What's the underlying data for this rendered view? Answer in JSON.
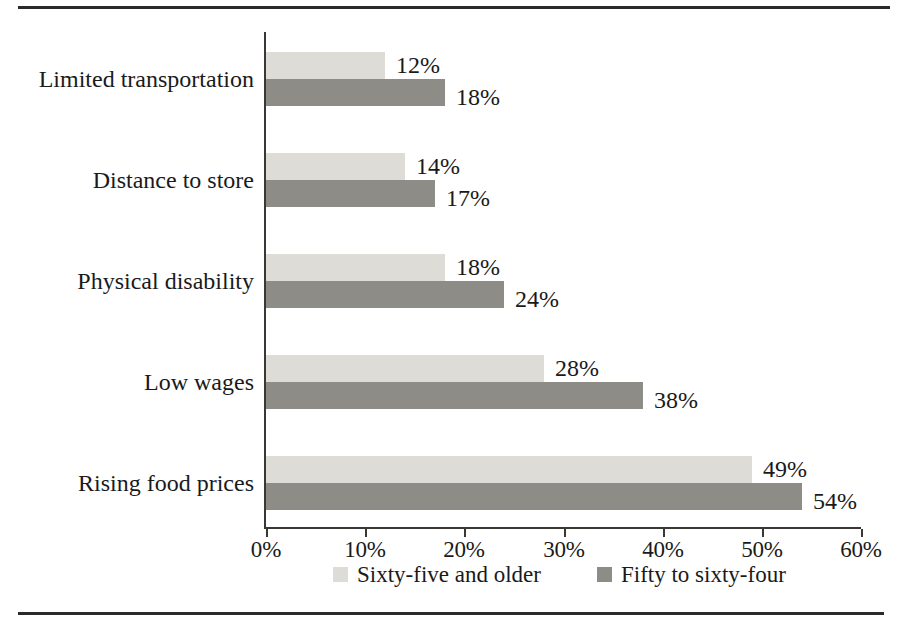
{
  "chart_data": {
    "type": "bar",
    "orientation": "horizontal",
    "title": "",
    "xlabel": "",
    "ylabel": "",
    "xlim": [
      0,
      60
    ],
    "grid": false,
    "legend_position": "bottom",
    "x_ticks": [
      "0%",
      "10%",
      "20%",
      "30%",
      "40%",
      "50%",
      "60%"
    ],
    "x_tick_values": [
      0,
      10,
      20,
      30,
      40,
      50,
      60
    ],
    "categories": [
      "Limited transportation",
      "Distance to store",
      "Physical disability",
      "Low wages",
      "Rising food prices"
    ],
    "series": [
      {
        "name": "Sixty-five and older",
        "color": "#dddcd6",
        "values": [
          12,
          14,
          18,
          28,
          49
        ],
        "labels": [
          "12%",
          "14%",
          "18%",
          "28%",
          "49%"
        ]
      },
      {
        "name": "Fifty to sixty-four",
        "color": "#8d8c86",
        "values": [
          18,
          17,
          24,
          38,
          54
        ],
        "labels": [
          "18%",
          "17%",
          "24%",
          "38%",
          "54%"
        ]
      }
    ]
  },
  "legend": {
    "items": [
      {
        "label": "Sixty-five and older",
        "swatch": "light"
      },
      {
        "label": "Fifty to sixty-four",
        "swatch": "dark"
      }
    ]
  }
}
